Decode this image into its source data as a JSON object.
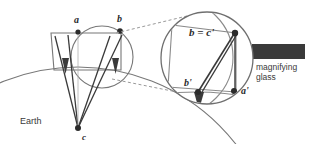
{
  "figure": {
    "background_color": "#ffffff",
    "line_color": "#555555",
    "dark_line_color": "#2b2b2b",
    "dashed_color": "#8a8a8a",
    "handle_color": "#3a3a3a",
    "label_color": "#2b2b2b"
  },
  "labels": {
    "point_a": "a",
    "point_b": "b",
    "point_c": "c",
    "earth": "Earth",
    "magnified_b_eq_c": "b = c'",
    "magnified_b_prime": "b'",
    "magnified_a_prime": "a'",
    "magnifier_line1": "magnifying",
    "magnifier_line2": "glass"
  },
  "geometry": {
    "earth_circle": {
      "cx": 78,
      "cy": 267,
      "r": 200
    },
    "earth_center_point": {
      "x": 78,
      "y": 128
    },
    "small_circle": {
      "cx": 102,
      "cy": 57,
      "r": 31
    },
    "magnifier_circle": {
      "cx": 207,
      "cy": 58,
      "r": 46
    },
    "magnifier_handle": {
      "x": 252,
      "y": 44,
      "w": 53,
      "h": 15
    },
    "points": {
      "a": {
        "x": 78,
        "y": 31
      },
      "b": {
        "x": 120,
        "y": 31
      },
      "c": {
        "x": 78,
        "y": 128
      },
      "b_eq_c_prime": {
        "x": 235,
        "y": 33
      },
      "b_prime": {
        "x": 196,
        "y": 93
      },
      "a_prime": {
        "x": 235,
        "y": 92
      }
    },
    "dashed_leader_upper": {
      "x1": 115,
      "y1": 33,
      "x2": 186,
      "y2": 16
    },
    "dashed_leader_lower": {
      "x1": 112,
      "y1": 79,
      "x2": 186,
      "y2": 93
    }
  }
}
